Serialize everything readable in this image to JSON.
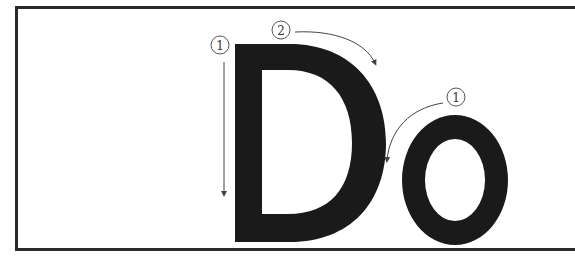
{
  "diagram": {
    "letters": [
      {
        "char": "D",
        "strokes": [
          {
            "number": "1",
            "direction": "down",
            "description": "vertical stem, top to bottom"
          },
          {
            "number": "2",
            "direction": "clockwise curve",
            "description": "bowl from top of stem around to bottom"
          }
        ]
      },
      {
        "char": "o",
        "strokes": [
          {
            "number": "1",
            "direction": "counter-clockwise",
            "description": "circle starting at top, going left"
          }
        ]
      }
    ],
    "colors": {
      "letter_fill": "#1a1a1a",
      "annotation": "#444444",
      "frame": "#2a2a2a",
      "background": "#ffffff"
    }
  }
}
